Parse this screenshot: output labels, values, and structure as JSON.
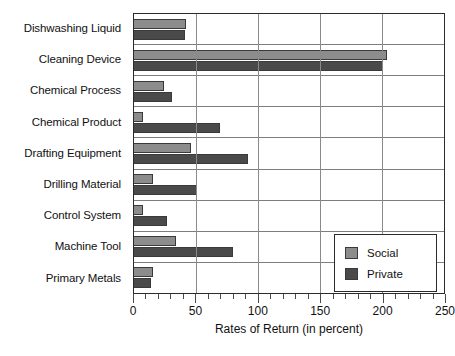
{
  "chart_data": {
    "type": "bar",
    "orientation": "horizontal",
    "title": "",
    "xlabel": "Rates of Return (in percent)",
    "ylabel": "",
    "xlim": [
      0,
      250
    ],
    "xticks": [
      0,
      50,
      100,
      150,
      200,
      250
    ],
    "xtick_labels": [
      "0",
      "50",
      "100",
      "150",
      "200",
      "250"
    ],
    "minor_tick_interval": 10,
    "grid": "category-separators-and-major-vertical",
    "legend_position": "lower-right-inside",
    "categories": [
      "Dishwashing Liquid",
      "Cleaning Device",
      "Chemical Process",
      "Chemical Product",
      "Drafting Equipment",
      "Drilling Material",
      "Control System",
      "Machine Tool",
      "Primary Metals"
    ],
    "series": [
      {
        "name": "Social",
        "color": "#8c8c8c",
        "values": [
          42,
          204,
          24,
          7,
          46,
          15,
          7,
          34,
          15
        ]
      },
      {
        "name": "Private",
        "color": "#4a4a4a",
        "values": [
          41,
          201,
          31,
          69,
          92,
          51,
          27,
          80,
          14
        ]
      }
    ]
  },
  "legend": {
    "items": [
      {
        "label": "Social"
      },
      {
        "label": "Private"
      }
    ]
  }
}
